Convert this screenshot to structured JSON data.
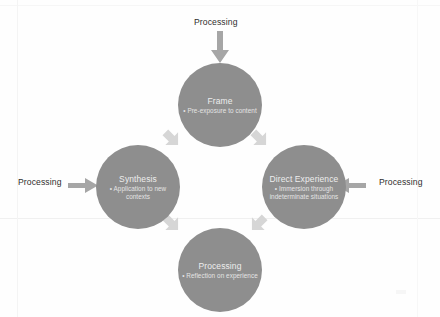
{
  "diagram": {
    "type": "cycle",
    "title": "",
    "nodes": [
      {
        "id": "frame",
        "title": "Frame",
        "bullet": "Pre-exposure to content",
        "position": "top"
      },
      {
        "id": "direct-experience",
        "title": "Direct Experience",
        "bullet": "Immersion through indeterminate situations",
        "position": "right"
      },
      {
        "id": "processing",
        "title": "Processing",
        "bullet": "Reflection on experience",
        "position": "bottom"
      },
      {
        "id": "synthesis",
        "title": "Synthesis",
        "bullet": "Application to new contexts",
        "position": "left"
      }
    ],
    "external_inputs": [
      {
        "id": "top",
        "label": "Processing",
        "direction": "down"
      },
      {
        "id": "left",
        "label": "Processing",
        "direction": "right"
      },
      {
        "id": "right",
        "label": "Processing",
        "direction": "left"
      }
    ],
    "connectors": [
      {
        "id": "upper-left",
        "from": "synthesis",
        "to": "frame",
        "direction": "up-left"
      },
      {
        "id": "upper-right",
        "from": "frame",
        "to": "direct-experience",
        "direction": "down-right"
      },
      {
        "id": "lower-right",
        "from": "direct-experience",
        "to": "processing",
        "direction": "down-left"
      },
      {
        "id": "lower-left",
        "from": "processing",
        "to": "synthesis",
        "direction": "up-left"
      }
    ],
    "colors": {
      "node_fill": "#8e8e8e",
      "node_text": "#ededed",
      "arrow_fill": "#a6a6a6",
      "connector_fill": "#d6d6d6",
      "label_text": "#2e2e2e",
      "background": "#fefefe"
    },
    "bullet_glyph": "•"
  }
}
